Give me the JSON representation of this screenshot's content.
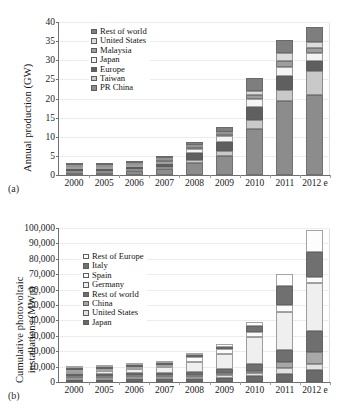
{
  "figure": {
    "panel_a_label": "(a)",
    "panel_b_label": "(b)"
  },
  "chart_data": [
    {
      "id": "a",
      "type": "bar",
      "stacked": true,
      "title": "",
      "xlabel": "",
      "ylabel": "Annual production (GW)",
      "ylim": [
        0,
        40
      ],
      "yticks": [
        0,
        5,
        10,
        15,
        20,
        25,
        30,
        35,
        40
      ],
      "ytick_labels": [
        "0",
        "5",
        "10",
        "15",
        "20",
        "25",
        "30",
        "35",
        "40"
      ],
      "grid": true,
      "legend_position": "upper left",
      "categories": [
        "2000",
        "2005",
        "2006",
        "2007",
        "2008",
        "2009",
        "2010",
        "2011",
        "2012 e"
      ],
      "series": [
        {
          "name": "PR China",
          "color": "#8c8c8c",
          "values": [
            0.05,
            0.6,
            1.0,
            1.6,
            3.2,
            5.0,
            12.0,
            19.3,
            21.0
          ]
        },
        {
          "name": "Taiwan",
          "color": "#c9c9c9",
          "values": [
            0.01,
            0.05,
            0.1,
            0.3,
            0.7,
            1.4,
            2.3,
            3.0,
            6.2
          ]
        },
        {
          "name": "Europe",
          "color": "#5f5f5f",
          "values": [
            0.06,
            0.3,
            0.4,
            0.7,
            1.8,
            2.2,
            3.5,
            3.7,
            2.6
          ]
        },
        {
          "name": "Japan",
          "color": "#f4f4f4",
          "values": [
            0.12,
            0.45,
            0.55,
            0.7,
            1.1,
            1.5,
            2.1,
            2.2,
            2.0
          ]
        },
        {
          "name": "Malaysia",
          "color": "#9d9d9d",
          "values": [
            0.0,
            0.0,
            0.0,
            0.05,
            0.2,
            0.4,
            1.0,
            1.6,
            1.5
          ]
        },
        {
          "name": "United States",
          "color": "#dcdcdc",
          "values": [
            0.08,
            0.2,
            0.25,
            0.35,
            0.5,
            0.7,
            1.2,
            2.0,
            1.6
          ]
        },
        {
          "name": "Rest of world",
          "color": "#7e7e7e",
          "values": [
            0.05,
            0.25,
            0.3,
            0.5,
            0.8,
            1.2,
            3.2,
            3.5,
            3.8
          ]
        }
      ],
      "legend_order": [
        "Rest of world",
        "United States",
        "Malaysia",
        "Japan",
        "Europe",
        "Taiwan",
        "PR China"
      ]
    },
    {
      "id": "b",
      "type": "bar",
      "stacked": true,
      "title": "",
      "xlabel": "",
      "ylabel_line1": "Cumulative photovoltaic",
      "ylabel_line2": "installations  (MWp)",
      "ylim": [
        0,
        100000
      ],
      "yticks": [
        0,
        10000,
        20000,
        30000,
        40000,
        50000,
        60000,
        70000,
        80000,
        90000,
        100000
      ],
      "ytick_labels": [
        "0",
        "10,000",
        "20,000",
        "30,000",
        "40,000",
        "50,000",
        "60,000",
        "70,000",
        "80,000",
        "90,000",
        "100,000"
      ],
      "grid": true,
      "legend_position": "upper left",
      "categories": [
        "2000",
        "2005",
        "2006",
        "2007",
        "2008",
        "2009",
        "2010",
        "2011",
        "2012 e"
      ],
      "series": [
        {
          "name": "Japan",
          "color": "#6a6a6a",
          "values": [
            330,
            1420,
            1710,
            1920,
            2150,
            2630,
            3620,
            4910,
            7500
          ]
        },
        {
          "name": "United States",
          "color": "#e2e2e2",
          "values": [
            140,
            480,
            660,
            900,
            1250,
            1750,
            2550,
            4400,
            4200
          ]
        },
        {
          "name": "China",
          "color": "#a8a8a8",
          "values": [
            20,
            70,
            100,
            150,
            200,
            400,
            900,
            3500,
            8000
          ]
        },
        {
          "name": "Rest of world",
          "color": "#6f6f6f",
          "values": [
            150,
            700,
            950,
            1350,
            1900,
            2700,
            4200,
            8000,
            13500
          ]
        },
        {
          "name": "Germany",
          "color": "#efefef",
          "values": [
            110,
            2000,
            2750,
            4150,
            6100,
            9800,
            17300,
            24800,
            31000
          ]
        },
        {
          "name": "Spain",
          "color": "#fbfbfb",
          "values": [
            10,
            60,
            150,
            700,
            3350,
            3450,
            3800,
            4200,
            4300
          ]
        },
        {
          "name": "Italy",
          "color": "#707070",
          "values": [
            20,
            50,
            60,
            120,
            450,
            1150,
            3500,
            12800,
            16000
          ]
        },
        {
          "name": "Rest of Europe",
          "color": "#fdfdfd",
          "values": [
            40,
            170,
            280,
            450,
            800,
            1500,
            2900,
            7500,
            14000
          ]
        }
      ],
      "legend_order": [
        "Rest of Europe",
        "Italy",
        "Spain",
        "Germany",
        "Rest of world",
        "China",
        "United States",
        "Japan"
      ]
    }
  ]
}
